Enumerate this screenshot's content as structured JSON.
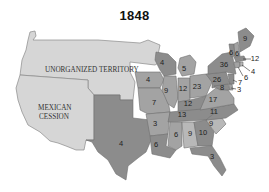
{
  "title": "1848",
  "colors": {
    "territory": "#d6d6d6",
    "state_dark": "#8c8c8c",
    "state_mid": "#a3a3a3",
    "state_light": "#b8b8b8",
    "water": "#ffffff",
    "border": "#6e6e6e"
  },
  "territories": [
    {
      "id": "unorganized",
      "label": "UNORGANIZED TERRITORY"
    },
    {
      "id": "mexican-cession",
      "label_line1": "MEXICAN",
      "label_line2": "CESSION"
    }
  ],
  "states": [
    {
      "id": "texas",
      "electoral_votes": "4"
    },
    {
      "id": "iowa",
      "electoral_votes": "4"
    },
    {
      "id": "missouri",
      "electoral_votes": "7"
    },
    {
      "id": "arkansas",
      "electoral_votes": "3"
    },
    {
      "id": "louisiana",
      "electoral_votes": "6"
    },
    {
      "id": "wisconsin",
      "electoral_votes": "4"
    },
    {
      "id": "illinois",
      "electoral_votes": "9"
    },
    {
      "id": "michigan",
      "electoral_votes": "5"
    },
    {
      "id": "indiana",
      "electoral_votes": "12"
    },
    {
      "id": "ohio",
      "electoral_votes": "23"
    },
    {
      "id": "kentucky",
      "electoral_votes": "12"
    },
    {
      "id": "tennessee",
      "electoral_votes": "13"
    },
    {
      "id": "mississippi",
      "electoral_votes": "6"
    },
    {
      "id": "alabama",
      "electoral_votes": "9"
    },
    {
      "id": "georgia",
      "electoral_votes": "10"
    },
    {
      "id": "florida",
      "electoral_votes": "3"
    },
    {
      "id": "south-carolina",
      "electoral_votes": "9"
    },
    {
      "id": "north-carolina",
      "electoral_votes": "11"
    },
    {
      "id": "virginia",
      "electoral_votes": "17"
    },
    {
      "id": "pennsylvania",
      "electoral_votes": "26"
    },
    {
      "id": "maryland",
      "electoral_votes": "8"
    },
    {
      "id": "delaware",
      "electoral_votes": "3"
    },
    {
      "id": "new-jersey",
      "electoral_votes": "7"
    },
    {
      "id": "new-york",
      "electoral_votes": "36"
    },
    {
      "id": "vermont",
      "electoral_votes": "6"
    },
    {
      "id": "new-hampshire",
      "electoral_votes": "6"
    },
    {
      "id": "maine",
      "electoral_votes": "9"
    },
    {
      "id": "massachusetts",
      "electoral_votes": "12"
    },
    {
      "id": "rhode-island",
      "electoral_votes": "4"
    },
    {
      "id": "connecticut",
      "electoral_votes": "6"
    }
  ]
}
